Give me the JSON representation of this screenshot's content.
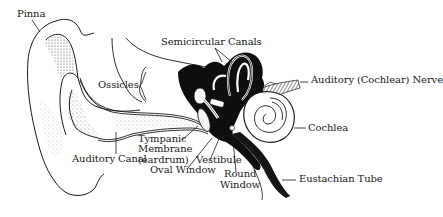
{
  "diagram": {
    "labels": {
      "pinna": "Pinna",
      "semicircular_canals": "Semicircular Canals",
      "ossicles": "Ossicles",
      "auditory_nerve": "Auditory (Cochlear) Nerve",
      "cochlea": "Cochlea",
      "tympanic_line1": "Tympanic",
      "tympanic_line2": "Membrane",
      "tympanic_line3": "(eardrum)",
      "auditory_canal": "Auditory Canal",
      "vestibule": "Vestibule",
      "oval_window": "Oval Window",
      "round_window_line1": "Round",
      "round_window_line2": "Window",
      "eustachian_tube": "Eustachian Tube"
    },
    "colors": {
      "ink": "#1a1a1a",
      "background": "#ffffff",
      "shade": "#555555"
    }
  }
}
